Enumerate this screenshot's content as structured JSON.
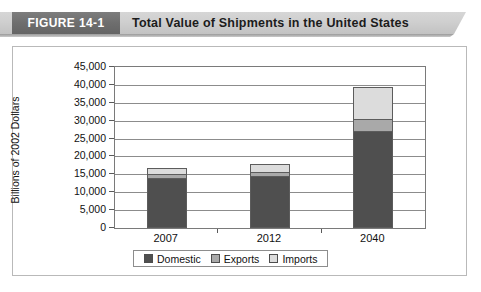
{
  "header": {
    "figure_number": "FIGURE 14-1",
    "title": "Total Value of Shipments in the United States"
  },
  "chart_data": {
    "type": "bar",
    "stacked": true,
    "title": "Total Value of Shipments in the United States",
    "xlabel": "",
    "ylabel": "Billions of 2002 Dollars",
    "categories": [
      "2007",
      "2012",
      "2040"
    ],
    "ylim": [
      0,
      45000
    ],
    "ytick_labels": [
      "0",
      "5,000",
      "10,000",
      "15,000",
      "20,000",
      "25,000",
      "30,000",
      "35,000",
      "40,000",
      "45,000"
    ],
    "ytick_values": [
      0,
      5000,
      10000,
      15000,
      20000,
      25000,
      30000,
      35000,
      40000,
      45000
    ],
    "grid": true,
    "legend_position": "bottom",
    "series": [
      {
        "name": "Domestic",
        "color": "#4f4f4f",
        "values": [
          14000,
          14500,
          27000
        ]
      },
      {
        "name": "Exports",
        "color": "#a9a9a9",
        "values": [
          1000,
          1200,
          3500
        ]
      },
      {
        "name": "Imports",
        "color": "#dcdcdc",
        "values": [
          1800,
          2100,
          9000
        ]
      }
    ]
  }
}
